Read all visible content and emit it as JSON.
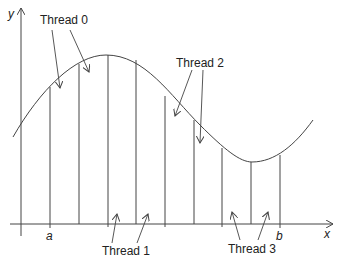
{
  "diagram": {
    "title": "",
    "axes": {
      "x_label": "x",
      "y_label": "y"
    },
    "bounds": {
      "lower": "a",
      "upper": "b"
    },
    "threads": [
      {
        "label": "Thread 0"
      },
      {
        "label": "Thread 1"
      },
      {
        "label": "Thread 2"
      },
      {
        "label": "Thread 3"
      }
    ],
    "line_color": "#444444"
  }
}
